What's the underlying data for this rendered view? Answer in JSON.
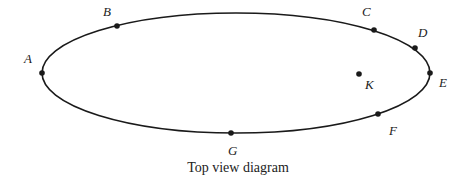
{
  "diagram": {
    "caption": "Top view diagram",
    "colors": {
      "stroke": "#1a1a1a",
      "text": "#222222",
      "background": "#ffffff"
    },
    "ellipse": {
      "cx": 236,
      "cy": 73,
      "rx": 194,
      "ry": 60
    },
    "points": [
      {
        "id": "A",
        "label": "A",
        "x": 42,
        "y": 73,
        "label_x": 24,
        "label_y": 63,
        "on_path": true
      },
      {
        "id": "B",
        "label": "B",
        "x": 117,
        "y": 26,
        "label_x": 103,
        "label_y": 16,
        "on_path": true
      },
      {
        "id": "C",
        "label": "C",
        "x": 374,
        "y": 30,
        "label_x": 362,
        "label_y": 16,
        "on_path": true
      },
      {
        "id": "D",
        "label": "D",
        "x": 415,
        "y": 48,
        "label_x": 418,
        "label_y": 37,
        "on_path": true
      },
      {
        "id": "E",
        "label": "E",
        "x": 430,
        "y": 73,
        "label_x": 439,
        "label_y": 87,
        "on_path": true
      },
      {
        "id": "F",
        "label": "F",
        "x": 378,
        "y": 114,
        "label_x": 389,
        "label_y": 135,
        "on_path": true
      },
      {
        "id": "G",
        "label": "G",
        "x": 231,
        "y": 133,
        "label_x": 228,
        "label_y": 155,
        "on_path": true
      },
      {
        "id": "K",
        "label": "K",
        "x": 359,
        "y": 74,
        "label_x": 365,
        "label_y": 89,
        "on_path": false
      }
    ]
  }
}
